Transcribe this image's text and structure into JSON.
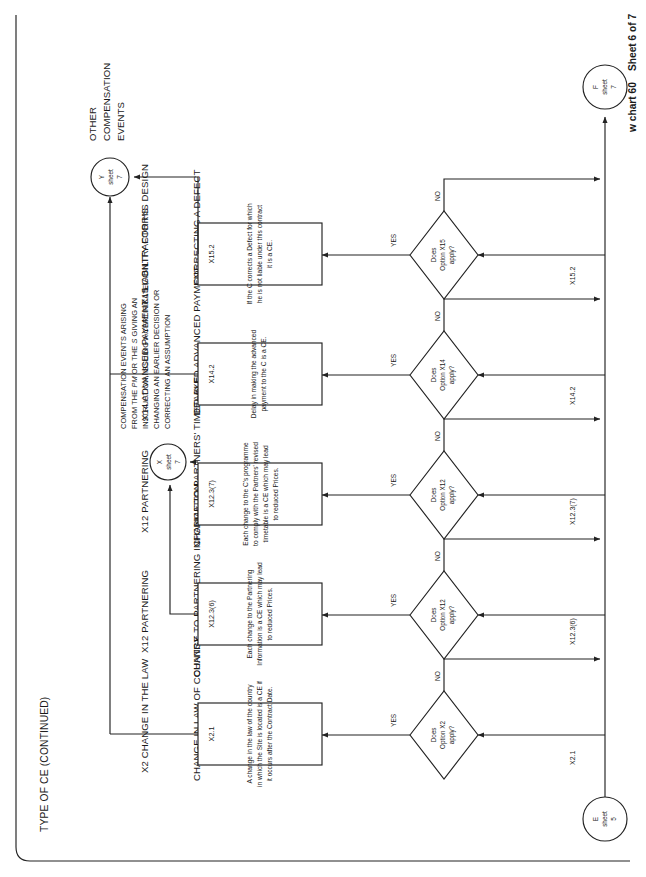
{
  "sheet": {
    "header": "TYPE OF CE (CONTINUED)",
    "caption_left": "w chart 60",
    "caption_right": "Sheet 6 of 7",
    "border_color": "#222222"
  },
  "entry_connector": {
    "letter": "E",
    "sheet_word": "sheet",
    "sheet_no": "5"
  },
  "exit_connector": {
    "letter": "F",
    "sheet_word": "sheet",
    "sheet_no": "7"
  },
  "x_connector": {
    "letter": "X",
    "sheet_word": "sheet",
    "sheet_no": "7"
  },
  "y_connector": {
    "letter": "Y",
    "sheet_word": "sheet",
    "sheet_no": "7"
  },
  "y_label": {
    "l1": "OTHER",
    "l2": "COMPENSATION",
    "l3": "EVENTS"
  },
  "annotation": {
    "l1": "COMPENSATION EVENTS ARISING",
    "l2a": "FROM THE ",
    "l2b": "PM",
    "l2c": " OR THE ",
    "l2d": "S",
    "l2e": " GIVING AN",
    "l3": "INSTRUCTION, ISSUING A CERTIFICATE,",
    "l4": "CHANGING AN EARLIER DECISION OR",
    "l5": "CORRECTING AN ASSUMPTION"
  },
  "yes_label": "YES",
  "no_label": "NO",
  "branches": [
    {
      "id": "x2",
      "option_heading": "X2 CHANGE IN THE LAW",
      "option_heading_l2": "",
      "tag": "X2.1",
      "decision": {
        "l1": "Does",
        "l2": "Option X2",
        "l3": "apply?"
      },
      "outcome_heading": "CHANGE IN LAW OF COUNTRY",
      "box_title": "X2.1",
      "box_lines": [
        "A change in the law of the country",
        "in which the Site is located is a CE if",
        "it occurs after the Contract Date."
      ]
    },
    {
      "id": "x12a",
      "option_heading": "X12 PARTNERING",
      "option_heading_l2": "",
      "tag": "X12.3(6)",
      "decision": {
        "l1": "Does",
        "l2": "Option X12",
        "l3": "apply?"
      },
      "outcome_heading": "CHANGE TO PARTNERING INFORMATION",
      "box_title": "X12.3(6)",
      "box_lines": [
        "Each change to the Partnering",
        "Information is a CE which may lead",
        "to reduced Prices."
      ]
    },
    {
      "id": "x12b",
      "option_heading": "X12 PARTNERING",
      "option_heading_l2": "",
      "tag": "X12.3(7)",
      "decision": {
        "l1": "Does",
        "l2": "Option X12",
        "l3": "apply?"
      },
      "outcome_heading": "CHANGE TO PARTNERS' TIMETABLE",
      "box_title": "X12.3(7)",
      "box_lines": [
        "Each change to the C's programme",
        "to comply with the Partners' revised",
        "timetable is a CE which may lead",
        "to reduced Prices."
      ]
    },
    {
      "id": "x14",
      "option_heading": "X14 ADVANCED PAYMENT",
      "option_heading_l2": "",
      "tag": "X14.2",
      "decision": {
        "l1": "Does",
        "l2": "Option X14",
        "l3": "apply?"
      },
      "outcome_heading": "DELAYED ADVANCED PAYMENT",
      "box_title": "X14.2",
      "box_lines": [
        "Delay in making the advanced",
        "payment to the C is a CE."
      ]
    },
    {
      "id": "x15",
      "option_heading": "X15 CONTRACTOR'S",
      "option_heading_l2": "LIABILITY FOR HIS DESIGN",
      "tag": "X15.2",
      "decision": {
        "l1": "Does",
        "l2": "Option X15",
        "l3": "apply?"
      },
      "outcome_heading": "CORRECTING A DEFECT",
      "box_title": "X15.2",
      "box_lines": [
        "If the C corrects a Defect for which",
        "he is not liable under this contract",
        "it is a CE."
      ]
    }
  ]
}
